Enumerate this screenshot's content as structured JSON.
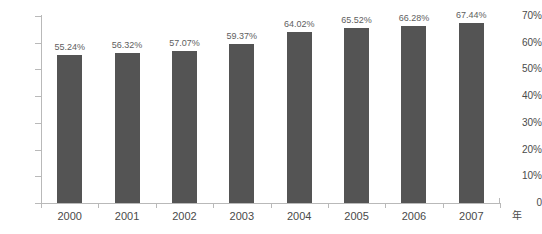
{
  "chart_data": {
    "type": "bar",
    "title": "",
    "subtitle": "",
    "xlabel": "年",
    "ylabel": "",
    "categories": [
      "2000",
      "2001",
      "2002",
      "2003",
      "2004",
      "2005",
      "2006",
      "2007"
    ],
    "values": [
      55.24,
      56.32,
      57.07,
      59.37,
      64.02,
      65.52,
      66.28,
      67.44
    ],
    "data_labels": [
      "55.24%",
      "56.32%",
      "57.07%",
      "59.37%",
      "64.02%",
      "65.52%",
      "66.28%",
      "67.44%"
    ],
    "ylim": [
      0,
      70
    ],
    "ytick_values": [
      70,
      60,
      50,
      40,
      30,
      20,
      10,
      0
    ],
    "ytick_labels": [
      "70%",
      "60%",
      "50%",
      "40%",
      "30%",
      "20%",
      "10%",
      "0"
    ],
    "grid": false,
    "legend": false,
    "legend_position": "none",
    "series": [
      {
        "name": "",
        "values": [
          55.24,
          56.32,
          57.07,
          59.37,
          64.02,
          65.52,
          66.28,
          67.44
        ],
        "color": "#545454"
      }
    ],
    "colors": {
      "bar": "#545454",
      "axis": "#b9b9b9",
      "tick_text": "#4a4a4a",
      "label_text": "#5e5e5e",
      "background": "#ffffff"
    }
  }
}
